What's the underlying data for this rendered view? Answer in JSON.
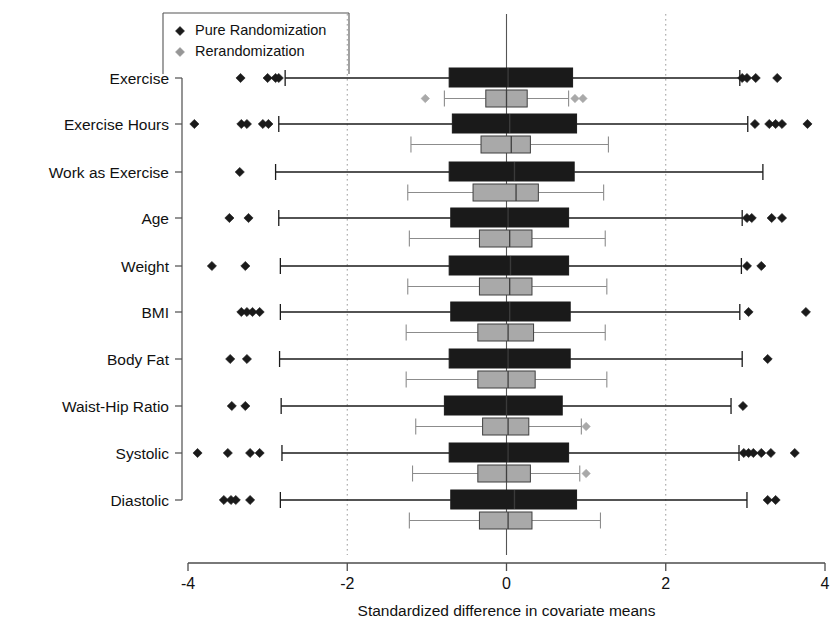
{
  "chart_data": {
    "type": "box",
    "title": "",
    "xlabel": "Standardized difference in covariate means",
    "ylabel": "",
    "xlim": [
      -4,
      4
    ],
    "xticks": [
      -4,
      -2,
      0,
      2,
      4
    ],
    "xticklabels": [
      "-4",
      "-2",
      "0",
      "2",
      "4"
    ],
    "grid": "vertical dotted at -2, 2; solid reference line at 0",
    "gridlines": [
      -2,
      0,
      2
    ],
    "legend": {
      "position": "top-left",
      "entries": [
        {
          "label": "Pure Randomization",
          "marker": "diamond",
          "color": "#1a1a1a"
        },
        {
          "label": "Rerandomization",
          "marker": "diamond",
          "color": "#969696"
        }
      ]
    },
    "categories": [
      "Exercise",
      "Exercise Hours",
      "Work as Exercise",
      "Age",
      "Weight",
      "BMI",
      "Body Fat",
      "Waist-Hip Ratio",
      "Systolic",
      "Diastolic"
    ],
    "series": [
      {
        "name": "Pure Randomization",
        "color": "#1a1a1a",
        "boxes": [
          {
            "category": "Exercise",
            "whisker_low": -2.78,
            "q1": -0.72,
            "median": 0.02,
            "q3": 0.83,
            "whisker_high": 2.93,
            "outliers": [
              -3.34,
              -3.0,
              -2.9,
              -2.86,
              2.96,
              3.02,
              3.13,
              3.4
            ]
          },
          {
            "category": "Exercise Hours",
            "whisker_low": -2.86,
            "q1": -0.68,
            "median": 0.04,
            "q3": 0.88,
            "whisker_high": 3.03,
            "outliers": [
              -3.92,
              -3.33,
              -3.26,
              -3.06,
              -2.99,
              3.12,
              3.3,
              3.38,
              3.46,
              3.78
            ]
          },
          {
            "category": "Work as Exercise",
            "whisker_low": -2.9,
            "q1": -0.72,
            "median": 0.1,
            "q3": 0.85,
            "whisker_high": 3.22,
            "outliers": [
              -3.35
            ]
          },
          {
            "category": "Age",
            "whisker_low": -2.86,
            "q1": -0.7,
            "median": 0.02,
            "q3": 0.78,
            "whisker_high": 2.96,
            "outliers": [
              -3.48,
              -3.24,
              3.02,
              3.08,
              3.33,
              3.46
            ]
          },
          {
            "category": "Weight",
            "whisker_low": -2.84,
            "q1": -0.72,
            "median": 0.05,
            "q3": 0.78,
            "whisker_high": 2.95,
            "outliers": [
              -3.7,
              -3.28,
              3.02,
              3.2
            ]
          },
          {
            "category": "BMI",
            "whisker_low": -2.84,
            "q1": -0.7,
            "median": 0.04,
            "q3": 0.8,
            "whisker_high": 2.93,
            "outliers": [
              -3.33,
              -3.26,
              -3.19,
              -3.1,
              3.04,
              3.76
            ]
          },
          {
            "category": "Body Fat",
            "whisker_low": -2.85,
            "q1": -0.72,
            "median": 0.02,
            "q3": 0.8,
            "whisker_high": 2.96,
            "outliers": [
              -3.47,
              -3.26,
              3.28
            ]
          },
          {
            "category": "Waist-Hip Ratio",
            "whisker_low": -2.83,
            "q1": -0.78,
            "median": 0.0,
            "q3": 0.7,
            "whisker_high": 2.82,
            "outliers": [
              -3.45,
              -3.28,
              2.97
            ]
          },
          {
            "category": "Systolic",
            "whisker_low": -2.82,
            "q1": -0.72,
            "median": 0.02,
            "q3": 0.78,
            "whisker_high": 2.92,
            "outliers": [
              -3.88,
              -3.5,
              -3.22,
              -3.1,
              2.98,
              3.04,
              3.1,
              3.2,
              3.32,
              3.62
            ]
          },
          {
            "category": "Diastolic",
            "whisker_low": -2.84,
            "q1": -0.7,
            "median": 0.1,
            "q3": 0.88,
            "whisker_high": 3.02,
            "outliers": [
              -3.55,
              -3.46,
              -3.4,
              -3.22,
              3.28,
              3.38
            ]
          }
        ]
      },
      {
        "name": "Rerandomization",
        "color": "#a9a9a9",
        "boxes": [
          {
            "category": "Exercise",
            "whisker_low": -0.78,
            "q1": -0.26,
            "median": 0.0,
            "q3": 0.26,
            "whisker_high": 0.78,
            "outliers": [
              -1.02,
              0.86,
              0.96
            ]
          },
          {
            "category": "Exercise Hours",
            "whisker_low": -1.2,
            "q1": -0.32,
            "median": 0.06,
            "q3": 0.3,
            "whisker_high": 1.28,
            "outliers": []
          },
          {
            "category": "Work as Exercise",
            "whisker_low": -1.24,
            "q1": -0.42,
            "median": 0.12,
            "q3": 0.4,
            "whisker_high": 1.22,
            "outliers": []
          },
          {
            "category": "Age",
            "whisker_low": -1.22,
            "q1": -0.34,
            "median": 0.04,
            "q3": 0.32,
            "whisker_high": 1.24,
            "outliers": []
          },
          {
            "category": "Weight",
            "whisker_low": -1.24,
            "q1": -0.34,
            "median": 0.04,
            "q3": 0.32,
            "whisker_high": 1.26,
            "outliers": []
          },
          {
            "category": "BMI",
            "whisker_low": -1.26,
            "q1": -0.36,
            "median": 0.02,
            "q3": 0.34,
            "whisker_high": 1.24,
            "outliers": []
          },
          {
            "category": "Body Fat",
            "whisker_low": -1.26,
            "q1": -0.36,
            "median": 0.02,
            "q3": 0.36,
            "whisker_high": 1.26,
            "outliers": []
          },
          {
            "category": "Waist-Hip Ratio",
            "whisker_low": -1.14,
            "q1": -0.3,
            "median": 0.02,
            "q3": 0.28,
            "whisker_high": 0.94,
            "outliers": [
              1.0
            ]
          },
          {
            "category": "Systolic",
            "whisker_low": -1.18,
            "q1": -0.36,
            "median": 0.0,
            "q3": 0.3,
            "whisker_high": 0.92,
            "outliers": [
              1.0
            ]
          },
          {
            "category": "Diastolic",
            "whisker_low": -1.22,
            "q1": -0.34,
            "median": 0.02,
            "q3": 0.32,
            "whisker_high": 1.18,
            "outliers": []
          }
        ]
      }
    ]
  },
  "axis": {
    "x_title": "Standardized difference in covariate means",
    "x_tick_labels": [
      "-4",
      "-2",
      "0",
      "2",
      "4"
    ],
    "y_tick_labels": [
      "Exercise",
      "Exercise Hours",
      "Work as Exercise",
      "Age",
      "Weight",
      "BMI",
      "Body Fat",
      "Waist-Hip Ratio",
      "Systolic",
      "Diastolic"
    ]
  },
  "legend": {
    "items": [
      "Pure Randomization",
      "Rerandomization"
    ]
  },
  "colors": {
    "pure_randomization": "#1a1a1a",
    "rerandomization": "#a9a9a9",
    "axis": "#4d4d4d",
    "grid": "#9a9a9a",
    "background": "#ffffff"
  }
}
